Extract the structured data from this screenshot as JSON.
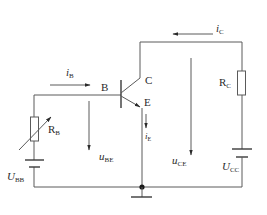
{
  "diagram": {
    "terminals": {
      "base": "B",
      "collector": "C",
      "emitter": "E"
    },
    "components": {
      "rb": {
        "main": "R",
        "sub": "B"
      },
      "rc": {
        "main": "R",
        "sub": "C"
      },
      "ubb": {
        "main": "U",
        "sub": "BB"
      },
      "ucc": {
        "main": "U",
        "sub": "CC"
      }
    },
    "currents": {
      "ib": {
        "main": "i",
        "sub": "B"
      },
      "ic": {
        "main": "i",
        "sub": "C"
      },
      "ie": {
        "main": "i",
        "sub": "E"
      }
    },
    "voltages": {
      "ube": {
        "main": "u",
        "sub": "BE"
      },
      "uce": {
        "main": "u",
        "sub": "CE"
      }
    },
    "colors": {
      "wire": "#5a5a5a",
      "text": "#2a2a2a",
      "background": "#ffffff"
    }
  }
}
